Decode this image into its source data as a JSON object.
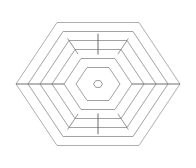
{
  "figure": {
    "background_color": "#ffffff",
    "canvas": {
      "width": 196,
      "height": 168
    },
    "center": {
      "x": 98,
      "y": 84
    },
    "orientation": "flat-top",
    "stroke_colors": {
      "ring": "#8a8a8a",
      "ring_outer": "#9a9a9a",
      "spoke": "#5f5f5f",
      "crosstie": "#7a7a7a",
      "core": "#8f8f8f"
    },
    "ring_count": 6,
    "caption": ""
  },
  "chart_data": {
    "type": "diagram",
    "xlabel": "",
    "ylabel": "",
    "rings": [
      {
        "index": 1,
        "name": "ring-outer",
        "radius": 82,
        "label": ""
      },
      {
        "index": 2,
        "name": "ring-2",
        "radius": 70,
        "label": ""
      },
      {
        "index": 3,
        "name": "ring-3",
        "radius": 58,
        "label": ""
      },
      {
        "index": 4,
        "name": "ring-4",
        "radius": 46,
        "label": ""
      },
      {
        "index": 5,
        "name": "ring-5",
        "radius": 34,
        "label": ""
      },
      {
        "index": 6,
        "name": "ring-inner",
        "radius": 22,
        "label": ""
      }
    ],
    "core": {
      "name": "core-hexagon",
      "radius": 4.5,
      "label": ""
    },
    "spokes": [
      {
        "name": "spoke-left",
        "angle_deg": 180,
        "from_radius": 34,
        "to_radius": 82
      },
      {
        "name": "spoke-right",
        "angle_deg": 0,
        "from_radius": 34,
        "to_radius": 82
      },
      {
        "name": "spoke-top",
        "angle_deg": 270,
        "from_radius": 34,
        "to_radius": 58
      },
      {
        "name": "spoke-bottom",
        "angle_deg": 90,
        "from_radius": 34,
        "to_radius": 58
      }
    ],
    "crossties": [
      {
        "name": "crosstie-upper-left",
        "sector_angle_deg": 240,
        "from_radius": 46,
        "to_radius": 70
      },
      {
        "name": "crosstie-upper-right",
        "sector_angle_deg": 300,
        "from_radius": 46,
        "to_radius": 70
      },
      {
        "name": "crosstie-lower-left",
        "sector_angle_deg": 120,
        "from_radius": 46,
        "to_radius": 70
      },
      {
        "name": "crosstie-lower-right",
        "sector_angle_deg": 60,
        "from_radius": 46,
        "to_radius": 70
      }
    ],
    "legend": [],
    "annotations": [],
    "grid": false
  }
}
